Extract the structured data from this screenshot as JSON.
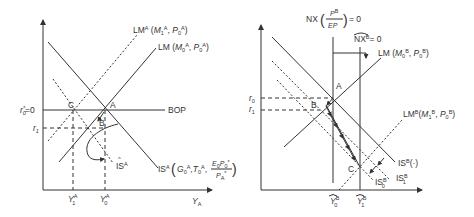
{
  "panel_a": {
    "title": "Country A",
    "axis_x_label": "Y",
    "axis_x_sub": "A",
    "curves": {
      "lm_shifted": {
        "name": "LM",
        "sup": "A",
        "args": "(M",
        "arg1_sub": "1",
        "arg1_sup": "A",
        "arg2": "P",
        "arg2_sub": "0",
        "arg2_sup": "A"
      },
      "lm_initial": {
        "name": "LM",
        "args": "(M",
        "arg1_sub": "0",
        "arg1_sup": "A",
        "arg2": "P",
        "arg2_sub": "0",
        "arg2_sup": "A"
      },
      "bop": {
        "name": "BOP"
      },
      "is_initial": {
        "name": "IS",
        "sup": "A",
        "g": "G",
        "g_sub": "0",
        "g_sup": "A",
        "t": "T",
        "t_sub": "0",
        "t_sup": "A",
        "num_e": "E",
        "num_e_sub": "0",
        "num_p": "P",
        "num_p_sub": "0",
        "num_p_sup": "*",
        "den_p": "P",
        "den_p_sub": "A",
        "den_p_sup": "*"
      },
      "is_hat": {
        "name": "IS",
        "hat": "^",
        "sup": "A"
      }
    },
    "rate_labels": {
      "r0": "r",
      "r0_sub": "0",
      "r0_sup": "*",
      "r0_eq": "=0",
      "r1": "r",
      "r1_sub": "1"
    },
    "income_labels": {
      "y1": "Y",
      "y1_sub": "1",
      "y1_sup": "A",
      "y0": "Y",
      "y0_sub": "0",
      "y0_sup": "A"
    },
    "points": {
      "a": "A",
      "b": "B",
      "c": "C"
    }
  },
  "panel_b": {
    "title": "Country B",
    "nx_label": {
      "prefix": "NX",
      "frac_num": "P",
      "frac_num_sup": "B",
      "frac_den": "EP",
      "suffix": "= 0"
    },
    "nx_hat_label": {
      "name": "NX",
      "sup": "B",
      "suffix": "= 0"
    },
    "curves": {
      "lm_initial": {
        "name": "LM",
        "args": "(M",
        "arg1_sub": "0",
        "arg1_sup": "B",
        "arg2": "P",
        "arg2_sub": "0",
        "arg2_sup": "B"
      },
      "lm_shifted": {
        "name": "LM",
        "sup": "B",
        "args": "(M",
        "arg1_sub": "1",
        "arg1_sup": "B",
        "arg2": "P",
        "arg2_sub": "0",
        "arg2_sup": "B"
      },
      "is_initial": {
        "name": "IS",
        "sup": "B",
        "args": "(·)"
      },
      "is_1": {
        "name": "IS",
        "sup": "B",
        "sub": "1"
      },
      "is_0": {
        "name": "IS",
        "sup": "B",
        "sub": "0"
      }
    },
    "rate_labels": {
      "r0": "r",
      "r0_sub": "0",
      "r1": "r",
      "r1_sub": "1"
    },
    "income_labels": {
      "y0": "Y",
      "y0_sub": "0",
      "y0_sup": "B",
      "y1": "Y",
      "y1_sub": "1",
      "y1_sup": "B"
    },
    "points": {
      "a": "A",
      "b": "B",
      "c": "C"
    }
  }
}
